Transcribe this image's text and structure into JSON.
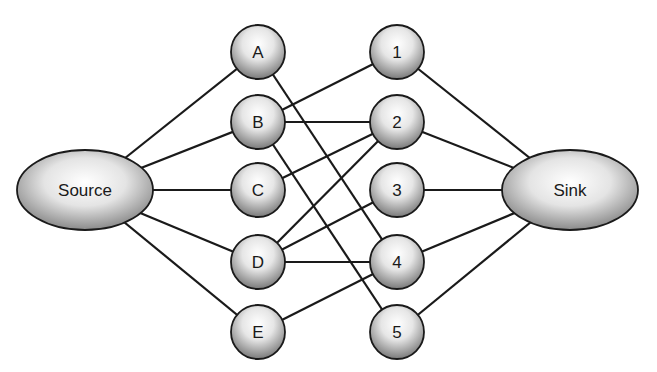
{
  "nodes": {
    "source": {
      "id": "source",
      "label": "Source",
      "cx": 85,
      "cy": 190,
      "rx": 68,
      "ry": 40
    },
    "sink": {
      "id": "sink",
      "label": "Sink",
      "cx": 570,
      "cy": 190,
      "rx": 68,
      "ry": 40
    },
    "left": [
      {
        "id": "A",
        "label": "A",
        "cx": 258,
        "cy": 52
      },
      {
        "id": "B",
        "label": "B",
        "cx": 258,
        "cy": 122
      },
      {
        "id": "C",
        "label": "C",
        "cx": 258,
        "cy": 190
      },
      {
        "id": "D",
        "label": "D",
        "cx": 258,
        "cy": 262
      },
      {
        "id": "E",
        "label": "E",
        "cx": 258,
        "cy": 332
      }
    ],
    "right": [
      {
        "id": "1",
        "label": "1",
        "cx": 397,
        "cy": 52
      },
      {
        "id": "2",
        "label": "2",
        "cx": 397,
        "cy": 122
      },
      {
        "id": "3",
        "label": "3",
        "cx": 397,
        "cy": 190
      },
      {
        "id": "4",
        "label": "4",
        "cx": 397,
        "cy": 262
      },
      {
        "id": "5",
        "label": "5",
        "cx": 397,
        "cy": 332
      }
    ],
    "radius": 27
  },
  "edges": [
    [
      "source",
      "A"
    ],
    [
      "source",
      "B"
    ],
    [
      "source",
      "C"
    ],
    [
      "source",
      "D"
    ],
    [
      "source",
      "E"
    ],
    [
      "A",
      "4"
    ],
    [
      "B",
      "1"
    ],
    [
      "B",
      "2"
    ],
    [
      "B",
      "5"
    ],
    [
      "C",
      "2"
    ],
    [
      "D",
      "2"
    ],
    [
      "D",
      "3"
    ],
    [
      "D",
      "4"
    ],
    [
      "E",
      "4"
    ],
    [
      "1",
      "sink"
    ],
    [
      "2",
      "sink"
    ],
    [
      "3",
      "sink"
    ],
    [
      "4",
      "sink"
    ],
    [
      "5",
      "sink"
    ]
  ]
}
